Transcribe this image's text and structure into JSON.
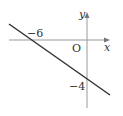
{
  "diagram": {
    "type": "coordinate-graph",
    "axes": {
      "x_label": "x",
      "y_label": "y",
      "origin_label": "O"
    },
    "line": {
      "x_intercept": -6,
      "y_intercept": -4
    },
    "labels": {
      "x_intercept": "−6",
      "y_intercept": "−4"
    },
    "colors": {
      "line": "#333333",
      "axis": "#999999"
    }
  }
}
